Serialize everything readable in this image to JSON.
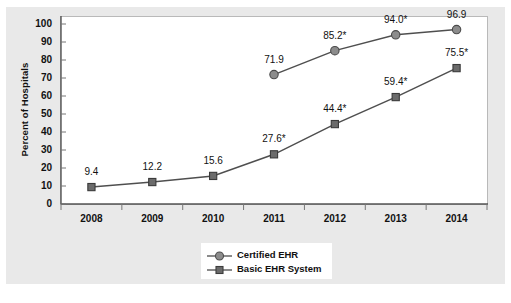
{
  "chart_data": {
    "type": "line",
    "title": "",
    "subtitle": "",
    "xlabel": "",
    "ylabel": "Percent of Hospitals",
    "categories": [
      "2008",
      "2009",
      "2010",
      "2011",
      "2012",
      "2013",
      "2014"
    ],
    "ylim": [
      0,
      100
    ],
    "yticks": [
      "0",
      "10",
      "20",
      "30",
      "40",
      "50",
      "60",
      "70",
      "80",
      "90",
      "100"
    ],
    "grid": false,
    "legend_position": "bottom-center",
    "series": [
      {
        "name": "Certified EHR",
        "marker": "circle",
        "color": "#8c8c8c",
        "x": [
          "2011",
          "2012",
          "2013",
          "2014"
        ],
        "values": [
          71.9,
          85.2,
          94.0,
          96.9
        ],
        "labels": [
          "71.9",
          "85.2*",
          "94.0*",
          "96.9"
        ]
      },
      {
        "name": "Basic EHR System",
        "marker": "square",
        "color": "#6b6b6b",
        "x": [
          "2008",
          "2009",
          "2010",
          "2011",
          "2012",
          "2013",
          "2014"
        ],
        "values": [
          9.4,
          12.2,
          15.6,
          27.6,
          44.4,
          59.4,
          75.5
        ],
        "labels": [
          "9.4",
          "12.2",
          "15.6",
          "27.6*",
          "44.4*",
          "59.4*",
          "75.5*"
        ]
      }
    ]
  },
  "legend": {
    "items": [
      {
        "label": "Certified EHR",
        "marker": "circle-marker"
      },
      {
        "label": "Basic EHR System",
        "marker": "square-marker"
      }
    ]
  },
  "colors": {
    "panel_background": "#e9e9e9",
    "plot_background": "#ffffff",
    "axis": "#555555",
    "certified_ehr": "#8c8c8c",
    "basic_ehr": "#6b6b6b",
    "text": "#111111"
  }
}
